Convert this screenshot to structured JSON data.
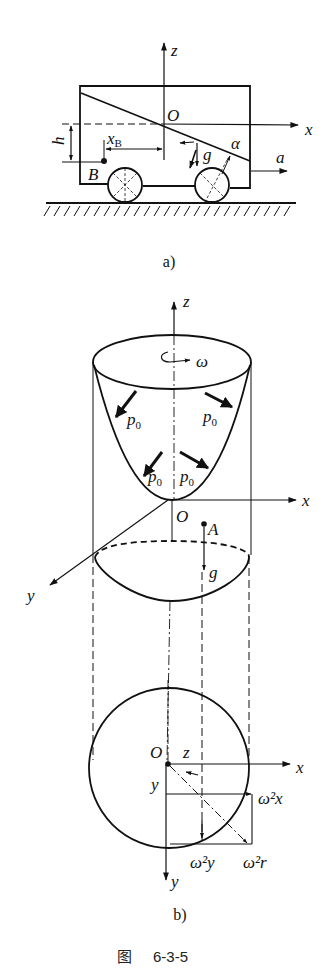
{
  "figure": {
    "number_prefix": "图",
    "number": "6-3-5"
  },
  "panel_a": {
    "caption": "a)",
    "labels": {
      "z": "z",
      "x": "x",
      "O": "O",
      "h": "h",
      "xB_main": "x",
      "xB_sub": "B",
      "B": "B",
      "g": "g",
      "alpha": "α",
      "a": "a"
    }
  },
  "panel_b": {
    "caption": "b)",
    "labels": {
      "z_top": "z",
      "omega": "ω",
      "p0": "p",
      "p0_sub": "0",
      "x_mid": "x",
      "O_mid": "O",
      "A": "A",
      "g": "g",
      "y_mid": "y",
      "O_bot": "O",
      "z_bot": "z",
      "x_bot": "x",
      "y_side": "y",
      "w2x": "ω²x",
      "w2y": "ω²y",
      "w2r": "ω²r",
      "y_bot": "y"
    }
  },
  "colors": {
    "ink": "#111111",
    "background": "#ffffff"
  }
}
